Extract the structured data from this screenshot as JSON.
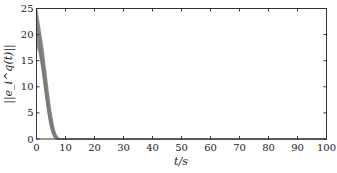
{
  "chart_data": {
    "type": "line",
    "title": "",
    "xlabel": "t/s",
    "ylabel": "||e_i^q(t)||",
    "xlim": [
      0,
      100
    ],
    "ylim": [
      0,
      25
    ],
    "xticks": [
      0,
      10,
      20,
      30,
      40,
      50,
      60,
      70,
      80,
      90,
      100
    ],
    "yticks": [
      0,
      5,
      10,
      15,
      20,
      25
    ],
    "grid": false,
    "legend": null,
    "line_color": "#7a7a7a",
    "series": [
      {
        "name": "agent 1",
        "x": [
          0,
          1,
          2,
          3,
          4,
          5,
          6,
          7,
          8,
          10,
          100
        ],
        "y": [
          25.0,
          21.5,
          18.0,
          13.5,
          9.0,
          5.0,
          2.0,
          0.5,
          0.05,
          0,
          0
        ]
      },
      {
        "name": "agent 2",
        "x": [
          0,
          1,
          2,
          3,
          4,
          5,
          6,
          7,
          8,
          10,
          100
        ],
        "y": [
          24.0,
          20.5,
          17.0,
          12.5,
          8.0,
          4.3,
          1.6,
          0.3,
          0.03,
          0,
          0
        ]
      },
      {
        "name": "agent 3",
        "x": [
          0,
          1,
          2,
          3,
          4,
          5,
          6,
          7,
          8,
          10,
          100
        ],
        "y": [
          23.0,
          19.5,
          16.0,
          11.5,
          7.2,
          3.6,
          1.2,
          0.2,
          0.02,
          0,
          0
        ]
      },
      {
        "name": "agent 4",
        "x": [
          0,
          1,
          2,
          3,
          4,
          5,
          6,
          7,
          8,
          10,
          100
        ],
        "y": [
          22.0,
          18.8,
          15.2,
          10.8,
          6.6,
          3.2,
          1.0,
          0.15,
          0.01,
          0,
          0
        ]
      },
      {
        "name": "agent 5",
        "x": [
          0,
          1,
          2,
          3,
          4,
          5,
          6,
          7,
          8,
          10,
          100
        ],
        "y": [
          21.0,
          18.0,
          14.5,
          10.2,
          6.0,
          2.8,
          0.8,
          0.1,
          0.01,
          0,
          0
        ]
      },
      {
        "name": "agent 6",
        "x": [
          0,
          1,
          2,
          3,
          4,
          5,
          6,
          7,
          8,
          10,
          100
        ],
        "y": [
          20.0,
          17.5,
          14.0,
          9.8,
          5.7,
          2.5,
          0.7,
          0.1,
          0,
          0,
          0
        ]
      },
      {
        "name": "agent 7",
        "x": [
          0,
          1,
          2,
          3,
          4,
          5,
          6,
          7,
          8,
          10,
          100
        ],
        "y": [
          19.0,
          17.0,
          13.6,
          9.4,
          5.4,
          2.3,
          0.6,
          0.08,
          0,
          0,
          0
        ]
      },
      {
        "name": "agent 8",
        "x": [
          0,
          1,
          2,
          3,
          4,
          5,
          6,
          7,
          8,
          10,
          100
        ],
        "y": [
          18.0,
          16.5,
          13.2,
          9.0,
          5.0,
          2.1,
          0.5,
          0.05,
          0,
          0,
          0
        ]
      }
    ]
  },
  "axes": {
    "x_ticks": [
      "0",
      "10",
      "20",
      "30",
      "40",
      "50",
      "60",
      "70",
      "80",
      "90",
      "100"
    ],
    "y_ticks": [
      "0",
      "5",
      "10",
      "15",
      "20",
      "25"
    ],
    "xlabel": "t/s",
    "ylabel": "||e_i^q(t)||"
  }
}
